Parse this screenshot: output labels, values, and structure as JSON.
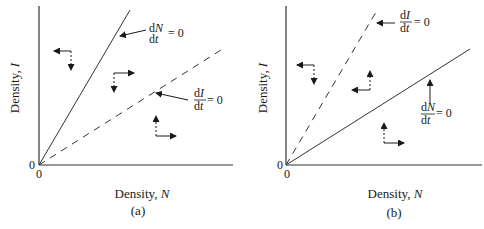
{
  "figure": {
    "panels": [
      {
        "id": "a",
        "caption": "(a)",
        "x_label": "Density, ",
        "x_label_var": "N",
        "y_label": "Density, ",
        "y_label_var": "I",
        "origin_x_tick": "0",
        "origin_y_tick": "0",
        "isoclines": [
          {
            "name": "dN/dt = 0",
            "style": "solid",
            "num_d": "d",
            "num_var": "N",
            "den": "dt",
            "eq": "= 0"
          },
          {
            "name": "dI/dt = 0",
            "style": "dashed",
            "num_d": "d",
            "num_var": "I",
            "den": "dt",
            "eq": "= 0"
          }
        ]
      },
      {
        "id": "b",
        "caption": "(b)",
        "x_label": "Density, ",
        "x_label_var": "N",
        "y_label": "Density, ",
        "y_label_var": "I",
        "origin_x_tick": "0",
        "origin_y_tick": "0",
        "isoclines": [
          {
            "name": "dI/dt = 0",
            "style": "dashed",
            "num_d": "d",
            "num_var": "I",
            "den": "dt",
            "eq": "= 0"
          },
          {
            "name": "dN/dt = 0",
            "style": "solid",
            "num_d": "d",
            "num_var": "N",
            "den": "dt",
            "eq": "= 0"
          }
        ]
      }
    ],
    "colors": {
      "ink": "#1a1a1a",
      "background": "#ffffff"
    }
  }
}
